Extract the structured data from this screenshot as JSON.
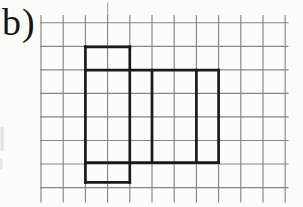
{
  "page": {
    "background": "#fcfcfb",
    "width": 303,
    "height": 207
  },
  "label": {
    "text": "b)",
    "color": "#161616"
  },
  "grid": {
    "line_color": "#868686",
    "line_width": 1.15,
    "x_lines": [
      41.0,
      63.2,
      85.4,
      107.6,
      129.8,
      152.0,
      174.2,
      196.4,
      218.6,
      240.8,
      263.0,
      285.2
    ],
    "y_lines": [
      22.7,
      46.3,
      69.8,
      93.4,
      116.9,
      140.5,
      164.0,
      187.6
    ],
    "h_extent": {
      "x1": 40.0,
      "x2": 288.5
    },
    "v_extent": {
      "y1": 15.0,
      "y2": 202.5
    },
    "top_stub": {
      "x": 107.6,
      "y1": 2.5,
      "y2": 15.0,
      "color": "#a8a8a8"
    }
  },
  "net": {
    "description": "bold outline of a cuboid net drawn on the squared grid",
    "line_color": "#1a1a1a",
    "line_width": 2.7,
    "segments": [
      {
        "x1": 85.4,
        "y1": 46.8,
        "x2": 129.8,
        "y2": 46.8
      },
      {
        "x1": 85.4,
        "y1": 46.8,
        "x2": 85.4,
        "y2": 182.3
      },
      {
        "x1": 129.8,
        "y1": 46.8,
        "x2": 129.8,
        "y2": 182.3
      },
      {
        "x1": 85.4,
        "y1": 70.2,
        "x2": 218.6,
        "y2": 70.2
      },
      {
        "x1": 152.0,
        "y1": 70.2,
        "x2": 152.0,
        "y2": 162.6
      },
      {
        "x1": 196.4,
        "y1": 70.2,
        "x2": 196.4,
        "y2": 162.6
      },
      {
        "x1": 218.6,
        "y1": 70.2,
        "x2": 218.6,
        "y2": 162.6
      },
      {
        "x1": 85.4,
        "y1": 162.6,
        "x2": 218.6,
        "y2": 162.6
      },
      {
        "x1": 85.4,
        "y1": 182.3,
        "x2": 129.8,
        "y2": 182.3
      }
    ]
  },
  "smudges": [
    {
      "x": 0.5,
      "y": 127,
      "w": 3.5,
      "h": 24,
      "color": "#b5b5b5",
      "opacity": 0.35
    },
    {
      "x": 0.0,
      "y": 158,
      "w": 2.5,
      "h": 12,
      "color": "#b5b5b5",
      "opacity": 0.3
    }
  ]
}
